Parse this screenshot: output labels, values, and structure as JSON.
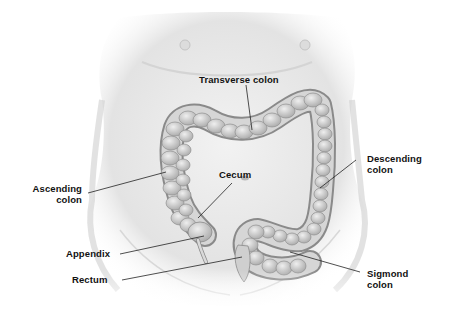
{
  "diagram": {
    "labels": {
      "transverse_colon": "Transverse colon",
      "ascending_colon_line1": "Ascending",
      "ascending_colon_line2": "colon",
      "descending_colon_line1": "Descending",
      "descending_colon_line2": "colon",
      "cecum": "Cecum",
      "appendix": "Appendix",
      "rectum": "Rectum",
      "sigmond_colon_line1": "Sigmond",
      "sigmond_colon_line2": "colon"
    },
    "colors": {
      "background": "#ffffff",
      "skin": "#e6e6e6",
      "skin_shadow": "#c8c8c8",
      "colon_fill": "#d2d2d2",
      "colon_edge": "#8a8a8a",
      "leader_line": "#222222",
      "label_text": "#111111"
    }
  }
}
